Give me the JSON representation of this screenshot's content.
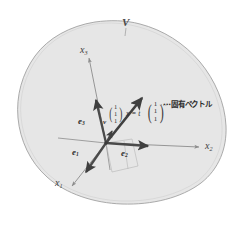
{
  "figure": {
    "title_label": "V",
    "space_name": "vector-space-V",
    "axes": [
      {
        "id": "x3",
        "label_base": "x",
        "label_sub": "3"
      },
      {
        "id": "x2",
        "label_base": "x",
        "label_sub": "2"
      },
      {
        "id": "x1",
        "label_base": "x",
        "label_sub": "1"
      }
    ],
    "basis_vectors": [
      {
        "id": "e3",
        "label_base": "e",
        "label_sub": "3"
      },
      {
        "id": "e1",
        "label_base": "e",
        "label_sub": "1"
      },
      {
        "id": "e2",
        "label_base": "e",
        "label_sub": "2"
      }
    ],
    "origin_vector_label": "v",
    "eigen_equation": "x = t",
    "eigen_vector_components": [
      "1",
      "1",
      "1"
    ],
    "result_vector_components": [
      "1",
      "1",
      "1"
    ],
    "annotation": "···固有ベクトル",
    "colors": {
      "blob_fill": "#e6e6e6",
      "blob_stroke": "#9a9a9a",
      "axis_stroke": "#8c8c8c",
      "vector_stroke": "#4a4a4a",
      "text": "#3a3a3a",
      "background": "#ffffff"
    }
  }
}
